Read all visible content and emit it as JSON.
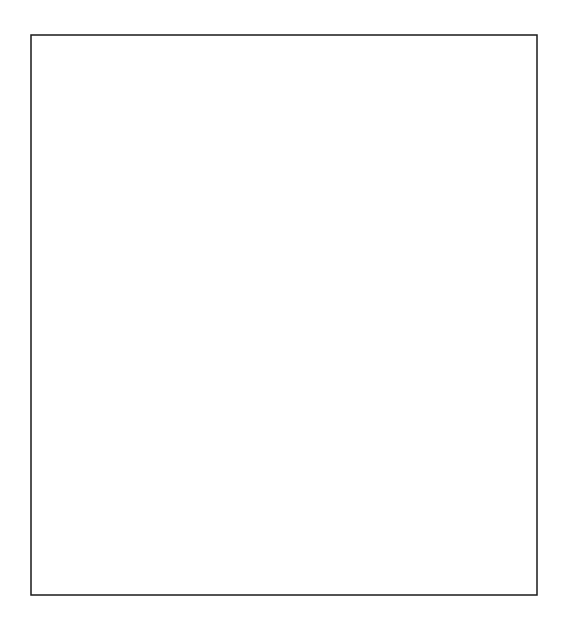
{
  "figure": {
    "kind": "line-drawing",
    "width": 568,
    "height": 634,
    "background_color": "#ffffff",
    "line_color": "#1a1a1a",
    "hub_color": "#000000"
  },
  "frame": {
    "name": "outer-border",
    "x": 31,
    "y": 35,
    "width": 506,
    "height": 560,
    "stroke_width": 1.5
  },
  "grid": {
    "cell": 22,
    "origin_x": 24,
    "origin_y": 28,
    "cols": 24,
    "rows": 27,
    "stroke_width": 1.1,
    "visible": true
  },
  "motif": {
    "name": "rosette",
    "description": "Four-hub circular rosette: N/S/E/W hub vertices joined by polygonal arcs, with rays radiating from each hub and a small rotated square at the centre.",
    "radius": 66,
    "ray_count_per_hub": 9,
    "inner_square_half": 22
  },
  "rosettes": [
    {
      "id": "r1",
      "cx": 145,
      "cy": 152,
      "label": "top-left-rosette"
    },
    {
      "id": "r2",
      "cx": 409,
      "cy": 152,
      "label": "top-right-rosette"
    },
    {
      "id": "r3",
      "cx": 277,
      "cy": 284,
      "label": "centre-upper-rosette"
    },
    {
      "id": "r4",
      "cx": 145,
      "cy": 416,
      "label": "bottom-left-rosette"
    },
    {
      "id": "r5",
      "cx": 409,
      "cy": 416,
      "label": "bottom-right-rosette"
    },
    {
      "id": "r6",
      "cx": 277,
      "cy": 548,
      "label": "bottom-centre-rosette"
    }
  ],
  "hubs": [
    {
      "x": 145,
      "y": 86
    },
    {
      "x": 79,
      "y": 152
    },
    {
      "x": 211,
      "y": 152
    },
    {
      "x": 145,
      "y": 218
    },
    {
      "x": 409,
      "y": 86
    },
    {
      "x": 343,
      "y": 152
    },
    {
      "x": 475,
      "y": 152
    },
    {
      "x": 409,
      "y": 218
    },
    {
      "x": 277,
      "y": 218
    },
    {
      "x": 211,
      "y": 284
    },
    {
      "x": 343,
      "y": 284
    },
    {
      "x": 277,
      "y": 350
    },
    {
      "x": 145,
      "y": 350
    },
    {
      "x": 79,
      "y": 416
    },
    {
      "x": 211,
      "y": 416
    },
    {
      "x": 145,
      "y": 482
    },
    {
      "x": 409,
      "y": 350
    },
    {
      "x": 343,
      "y": 416
    },
    {
      "x": 475,
      "y": 416
    },
    {
      "x": 409,
      "y": 482
    },
    {
      "x": 277,
      "y": 482
    },
    {
      "x": 343,
      "y": 548
    },
    {
      "x": 211,
      "y": 548
    }
  ],
  "bevels": [
    {
      "name": "top-left-bevel",
      "x1": 36,
      "y1": 128,
      "x2": 130,
      "y2": 37
    },
    {
      "name": "top-mid-bevel",
      "x1": 232,
      "y1": 128,
      "x2": 322,
      "y2": 37
    },
    {
      "name": "left-mid-bevel",
      "x1": 36,
      "y1": 284,
      "x2": 124,
      "y2": 196
    },
    {
      "name": "centre-bevel",
      "x1": 124,
      "y1": 284,
      "x2": 214,
      "y2": 196
    },
    {
      "name": "centre-lower-bevel",
      "x1": 190,
      "y1": 416,
      "x2": 278,
      "y2": 328
    },
    {
      "name": "right-mid-bevel",
      "x1": 322,
      "y1": 240,
      "x2": 410,
      "y2": 152
    },
    {
      "name": "bottom-left-bevel",
      "x1": 124,
      "y1": 548,
      "x2": 212,
      "y2": 460
    },
    {
      "name": "bottom-right-bevel",
      "x1": 366,
      "y1": 548,
      "x2": 454,
      "y2": 460
    },
    {
      "name": "bottom-mid-bevel",
      "x1": 278,
      "y1": 592,
      "x2": 366,
      "y2": 504
    }
  ],
  "legend": {
    "visible": false,
    "entries": []
  },
  "labels": {
    "visible": false,
    "items": []
  },
  "chart_data": {
    "type": "table",
    "xlabel": "",
    "ylabel": "",
    "categories": [
      "top-left-rosette",
      "top-right-rosette",
      "centre-upper-rosette",
      "bottom-left-rosette",
      "bottom-right-rosette",
      "bottom-centre-rosette"
    ],
    "values": [
      1,
      1,
      1,
      1,
      1,
      1
    ]
  }
}
